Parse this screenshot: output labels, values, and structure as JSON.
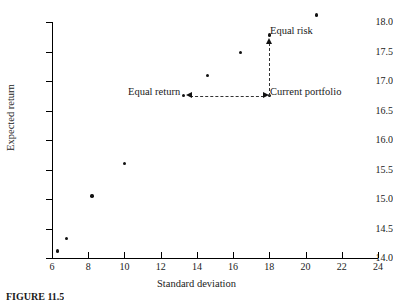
{
  "figure": {
    "caption": "FIGURE 11.5"
  },
  "chart_data": {
    "type": "scatter",
    "title": "",
    "xlabel": "Standard deviation",
    "ylabel": "Expected return",
    "xlim": [
      6,
      24
    ],
    "ylim": [
      14.0,
      18.0
    ],
    "xticks": [
      6,
      8,
      10,
      12,
      14,
      16,
      18,
      20,
      22,
      24
    ],
    "xticklabels": [
      "6",
      "8",
      "10",
      "12",
      "14",
      "16",
      "18",
      "20",
      "22",
      "24"
    ],
    "yticks": [
      14.0,
      14.5,
      15.0,
      15.5,
      16.0,
      16.5,
      17.0,
      17.5,
      18.0
    ],
    "yticklabels": [
      "14.0",
      "14.5",
      "15.0",
      "15.5",
      "16.0",
      "16.5",
      "17.0",
      "17.5",
      "18.0"
    ],
    "grid": false,
    "legend": null,
    "points": [
      {
        "x": 6.3,
        "y": 14.12,
        "label": ""
      },
      {
        "x": 6.8,
        "y": 14.33,
        "label": ""
      },
      {
        "x": 8.2,
        "y": 15.05,
        "label": ""
      },
      {
        "x": 10.0,
        "y": 15.6,
        "label": ""
      },
      {
        "x": 13.25,
        "y": 16.75,
        "label": "Equal return"
      },
      {
        "x": 14.6,
        "y": 17.09,
        "label": ""
      },
      {
        "x": 16.4,
        "y": 17.48,
        "label": ""
      },
      {
        "x": 18.0,
        "y": 17.78,
        "label": "Equal risk"
      },
      {
        "x": 18.0,
        "y": 16.75,
        "label": "Current portfolio"
      },
      {
        "x": 20.6,
        "y": 18.12,
        "label": ""
      }
    ],
    "annotations": [
      {
        "name": "equal-risk",
        "text": "Equal risk",
        "x": 18.0,
        "y": 17.78
      },
      {
        "name": "current-portfolio",
        "text": "Current portfolio",
        "x": 18.0,
        "y": 16.75
      },
      {
        "name": "equal-return",
        "text": "Equal return",
        "x": 13.25,
        "y": 16.75
      }
    ],
    "connectors": [
      {
        "name": "horizontal-dashed",
        "from": [
          18.0,
          16.75
        ],
        "to": [
          13.25,
          16.75
        ],
        "style": "dashed",
        "arrow": "both"
      },
      {
        "name": "vertical-dashed",
        "from": [
          18.0,
          16.75
        ],
        "to": [
          18.0,
          17.78
        ],
        "style": "dashed",
        "arrow": "up"
      }
    ],
    "colors": {
      "marker": "#111111",
      "axis": "#000000",
      "dash": "#333333",
      "background": "#ffffff"
    }
  }
}
